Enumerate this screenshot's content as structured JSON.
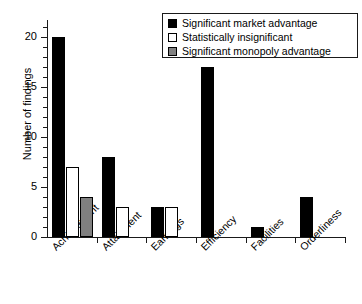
{
  "chart_data": {
    "type": "bar",
    "title": "",
    "subtitle": "",
    "xlabel": "",
    "ylabel": "Number of findings",
    "categories": [
      "Achievement",
      "Attainment",
      "Earnings",
      "Efficiency",
      "Facilities",
      "Orderliness"
    ],
    "series": [
      {
        "name": "Significant market advantage",
        "color": "#000000",
        "values": [
          20,
          8,
          3,
          17,
          1,
          4
        ]
      },
      {
        "name": "Statistically insignificant",
        "color": "#ffffff",
        "values": [
          7,
          3,
          3,
          0,
          0,
          0
        ]
      },
      {
        "name": "Significant monopoly advantage",
        "color": "#808080",
        "values": [
          4,
          0,
          0,
          0,
          0,
          0
        ]
      }
    ],
    "ylim": [
      0,
      21.7
    ],
    "ytick_labels": [
      "0",
      "5",
      "10",
      "15",
      "20"
    ],
    "ytick_values": [
      0,
      5,
      10,
      15,
      20
    ],
    "yminor_step": 1,
    "grid": false,
    "legend_position": "top-right",
    "xtick_label_rotation": -45
  },
  "legend": {
    "items": [
      {
        "label": "Significant market advantage",
        "swatch": "black-square-swatch"
      },
      {
        "label": "Statistically insignificant",
        "swatch": "white-square-swatch"
      },
      {
        "label": "Significant monopoly advantage",
        "swatch": "gray-square-swatch"
      }
    ]
  }
}
